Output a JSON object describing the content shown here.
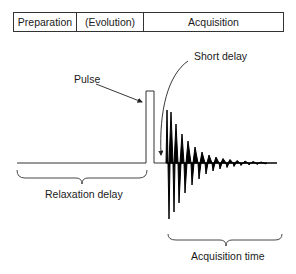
{
  "stages": [
    {
      "label": "Preparation"
    },
    {
      "label": "(Evolution)"
    },
    {
      "label": "Acquisition"
    }
  ],
  "labels": {
    "pulse": "Pulse",
    "short_delay": "Short delay",
    "relaxation_delay": "Relaxation delay",
    "acquisition_time": "Acquisition time"
  },
  "colors": {
    "line": "#333333",
    "signal": "#000000",
    "text": "#1a1a1a"
  }
}
